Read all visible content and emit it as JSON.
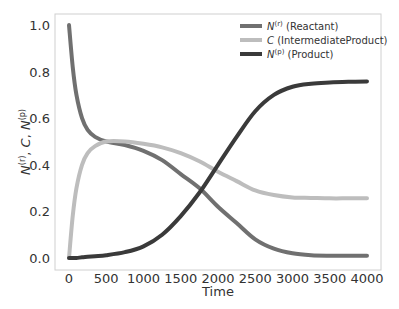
{
  "chart_data": {
    "type": "line",
    "title": "",
    "xlabel": "Time",
    "ylabel": "N^(r), C, N^(p)",
    "xlim": [
      0,
      4000
    ],
    "ylim": [
      0.0,
      1.0
    ],
    "grid": false,
    "legend_position": "upper right",
    "x_ticks": [
      "0",
      "500",
      "1000",
      "1500",
      "2000",
      "2500",
      "3000",
      "3500",
      "4000"
    ],
    "y_ticks": [
      "0.0",
      "0.2",
      "0.4",
      "0.6",
      "0.8",
      "1.0"
    ],
    "x": [
      0,
      50,
      100,
      175,
      250,
      350,
      500,
      750,
      1000,
      1250,
      1500,
      1750,
      2000,
      2250,
      2500,
      2750,
      3000,
      3250,
      3500,
      3750,
      4000
    ],
    "series": [
      {
        "name": "N(r) (Reactant)",
        "legend_base": "N",
        "legend_sup": "(r)",
        "legend_suffix": " (Reactant)",
        "color": "#707070",
        "values": [
          1.0,
          0.82,
          0.7,
          0.6,
          0.55,
          0.52,
          0.5,
          0.485,
          0.46,
          0.42,
          0.36,
          0.3,
          0.22,
          0.15,
          0.08,
          0.04,
          0.02,
          0.012,
          0.01,
          0.01,
          0.01
        ]
      },
      {
        "name": "C (IntermediateProduct)",
        "legend_base": "C",
        "legend_sup": "",
        "legend_suffix": " (IntermediateProduct)",
        "color": "#bdbdbd",
        "values": [
          0.0,
          0.18,
          0.3,
          0.4,
          0.45,
          0.48,
          0.5,
          0.5,
          0.49,
          0.475,
          0.45,
          0.415,
          0.37,
          0.33,
          0.29,
          0.27,
          0.26,
          0.258,
          0.256,
          0.256,
          0.256
        ]
      },
      {
        "name": "N(p) (Product)",
        "legend_base": "N",
        "legend_sup": "(p)",
        "legend_suffix": " (Product)",
        "color": "#3a3a3a",
        "values": [
          0.0,
          0.0,
          0.0,
          0.003,
          0.005,
          0.008,
          0.012,
          0.025,
          0.05,
          0.1,
          0.18,
          0.28,
          0.4,
          0.52,
          0.63,
          0.7,
          0.735,
          0.748,
          0.753,
          0.756,
          0.758
        ]
      }
    ]
  }
}
